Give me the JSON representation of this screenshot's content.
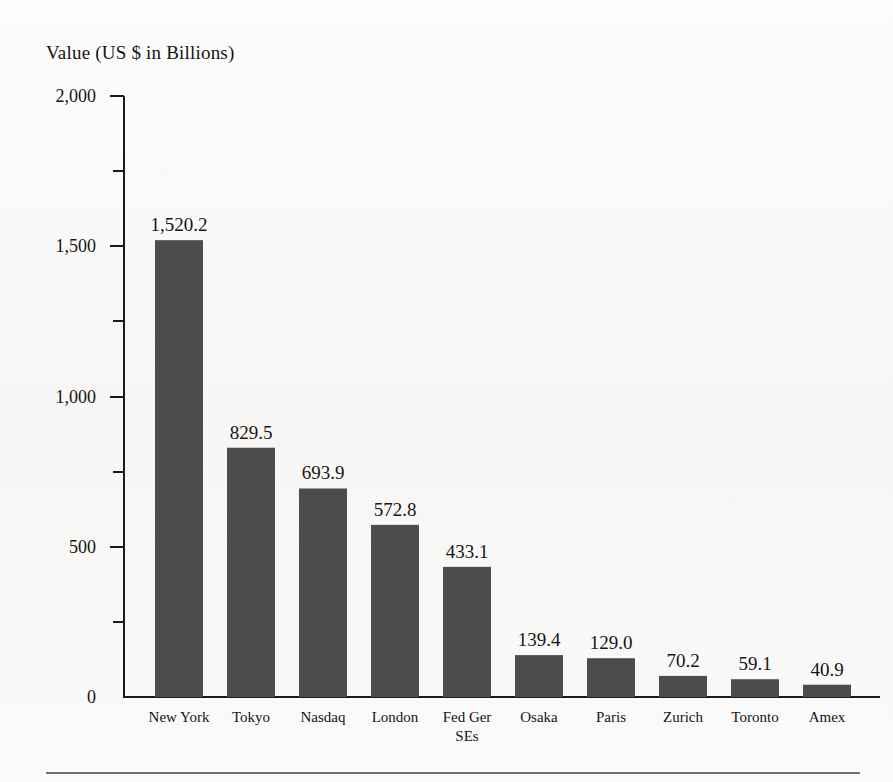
{
  "chart_data": {
    "type": "bar",
    "title": "Value (US $ in Billions)",
    "xlabel": "",
    "ylabel": "Value (US $ in Billions)",
    "categories": [
      "New York",
      "Tokyo",
      "Nasdaq",
      "London",
      "Fed Ger SEs",
      "Osaka",
      "Paris",
      "Zurich",
      "Toronto",
      "Amex"
    ],
    "category_lines": [
      [
        "New York"
      ],
      [
        "Tokyo"
      ],
      [
        "Nasdaq"
      ],
      [
        "London"
      ],
      [
        "Fed Ger",
        "SEs"
      ],
      [
        "Osaka"
      ],
      [
        "Paris"
      ],
      [
        "Zurich"
      ],
      [
        "Toronto"
      ],
      [
        "Amex"
      ]
    ],
    "values": [
      1520.2,
      829.5,
      693.9,
      572.8,
      433.1,
      139.4,
      129.0,
      70.2,
      59.1,
      40.9
    ],
    "value_labels": [
      "1,520.2",
      "829.5",
      "693.9",
      "572.8",
      "433.1",
      "139.4",
      "129.0",
      "70.2",
      "59.1",
      "40.9"
    ],
    "ylim": [
      0,
      2000
    ],
    "y_major_ticks": [
      0,
      500,
      1000,
      1500,
      2000
    ],
    "y_major_tick_labels": [
      "0",
      "500",
      "1,000",
      "1,500",
      "2,000"
    ],
    "y_minor_ticks": [
      250,
      750,
      1250,
      1750
    ],
    "grid": false,
    "legend": false,
    "legend_position": "none",
    "bar_color": "#4c4c4c",
    "axis_color": "#1b1b1b",
    "background_color": "#fbfafa",
    "text_color": "#151515"
  },
  "layout": {
    "plot_left": 124,
    "plot_right": 880,
    "baseline_y": 697,
    "top_y": 96,
    "bar_width": 48,
    "bar_pitch": 72,
    "first_bar_left": 155,
    "major_tick_length": 14,
    "minor_tick_length": 11
  },
  "footer": {
    "rule_visible": true
  }
}
